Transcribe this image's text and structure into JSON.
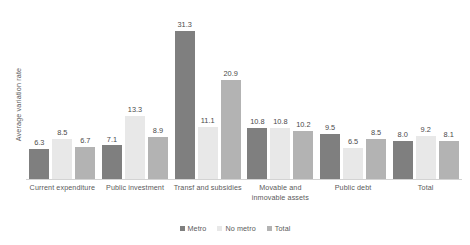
{
  "chart_data": {
    "type": "bar",
    "title": "",
    "subtitle": "",
    "xlabel": "",
    "ylabel": "Average variation rate",
    "ylim": [
      0,
      33
    ],
    "grid": false,
    "legend_position": "bottom",
    "axis_tick_labels": [],
    "categories": [
      "Current expenditure",
      "Public investment",
      "Transf and subsidies",
      "Movable and inmovable assets",
      "Public debt",
      "Total"
    ],
    "category_lines": [
      [
        "Current expenditure"
      ],
      [
        "Public investment"
      ],
      [
        "Transf and subsidies"
      ],
      [
        "Movable and",
        "inmovable assets"
      ],
      [
        "Public debt"
      ],
      [
        "Total"
      ]
    ],
    "series": [
      {
        "name": "Metro",
        "color": "#7f7f7f",
        "values": [
          6.3,
          7.1,
          31.3,
          10.8,
          9.5,
          8.0
        ],
        "labels": [
          "6.3",
          "7.1",
          "31.3",
          "10.8",
          "9.5",
          "8.0"
        ]
      },
      {
        "name": "No metro",
        "color": "#e8e8e8",
        "values": [
          8.5,
          13.3,
          11.1,
          10.8,
          6.5,
          9.2
        ],
        "labels": [
          "8.5",
          "13.3",
          "11.1",
          "10.8",
          "6.5",
          "9.2"
        ]
      },
      {
        "name": "Total",
        "color": "#b3b3b3",
        "values": [
          6.7,
          8.9,
          20.9,
          10.2,
          8.5,
          8.1
        ],
        "labels": [
          "6.7",
          "8.9",
          "20.9",
          "10.2",
          "8.5",
          "8.1"
        ]
      }
    ]
  },
  "colors": {
    "background": "#ffffff",
    "axis_line": "#d3d3d3",
    "text": "#5a5a5a",
    "value_text": "#4a4a4a",
    "series_metro": "#7f7f7f",
    "series_no_metro": "#e8e8e8",
    "series_total": "#b3b3b3"
  }
}
